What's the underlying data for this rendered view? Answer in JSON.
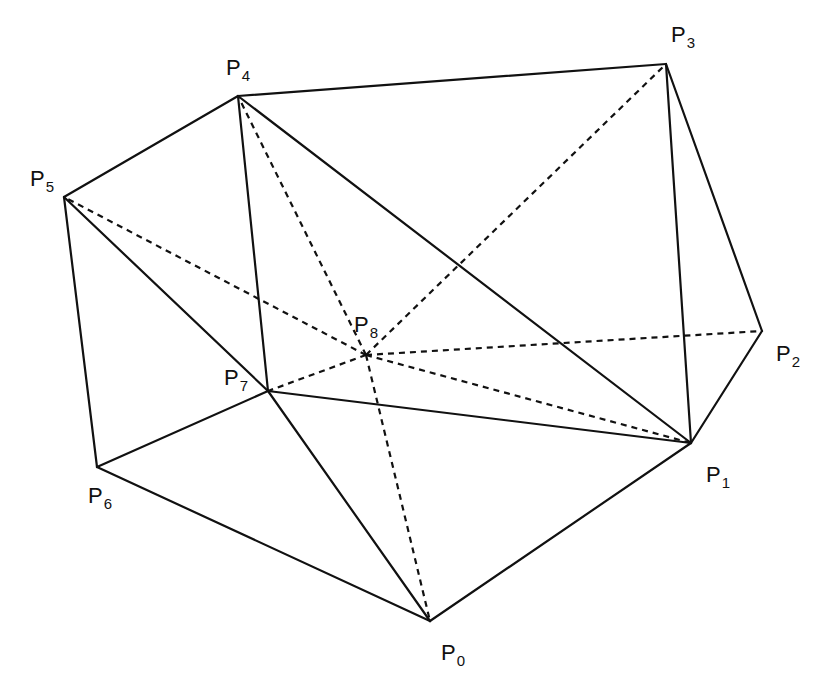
{
  "diagram": {
    "type": "triangulation",
    "stroke_color": "#111111",
    "background": "#ffffff",
    "points": [
      {
        "id": "P0",
        "base": "P",
        "sub": "0",
        "x": 430,
        "y": 621,
        "lx": 441,
        "ly": 660
      },
      {
        "id": "P1",
        "base": "P",
        "sub": "1",
        "x": 691,
        "y": 443,
        "lx": 706,
        "ly": 482
      },
      {
        "id": "P2",
        "base": "P",
        "sub": "2",
        "x": 762,
        "y": 331,
        "lx": 776,
        "ly": 361
      },
      {
        "id": "P3",
        "base": "P",
        "sub": "3",
        "x": 666,
        "y": 64,
        "lx": 671,
        "ly": 42
      },
      {
        "id": "P4",
        "base": "P",
        "sub": "4",
        "x": 238,
        "y": 96,
        "lx": 226,
        "ly": 75
      },
      {
        "id": "P5",
        "base": "P",
        "sub": "5",
        "x": 64,
        "y": 197,
        "lx": 30,
        "ly": 186
      },
      {
        "id": "P6",
        "base": "P",
        "sub": "6",
        "x": 97,
        "y": 467,
        "lx": 88,
        "ly": 503
      },
      {
        "id": "P7",
        "base": "P",
        "sub": "7",
        "x": 268,
        "y": 391,
        "lx": 224,
        "ly": 385
      },
      {
        "id": "P8",
        "base": "P",
        "sub": "8",
        "x": 366,
        "y": 355,
        "lx": 354,
        "ly": 332
      }
    ],
    "solid_edges": [
      [
        "P4",
        "P3"
      ],
      [
        "P3",
        "P2"
      ],
      [
        "P2",
        "P1"
      ],
      [
        "P1",
        "P0"
      ],
      [
        "P0",
        "P6"
      ],
      [
        "P6",
        "P5"
      ],
      [
        "P5",
        "P4"
      ],
      [
        "P3",
        "P1"
      ],
      [
        "P4",
        "P1"
      ],
      [
        "P4",
        "P7"
      ],
      [
        "P5",
        "P7"
      ],
      [
        "P7",
        "P0"
      ],
      [
        "P7",
        "P1"
      ],
      [
        "P7",
        "P6"
      ]
    ],
    "dashed_edges": [
      [
        "P8",
        "P4"
      ],
      [
        "P8",
        "P3"
      ],
      [
        "P8",
        "P5"
      ],
      [
        "P8",
        "P2"
      ],
      [
        "P8",
        "P1"
      ],
      [
        "P8",
        "P7"
      ],
      [
        "P8",
        "P0"
      ]
    ]
  }
}
